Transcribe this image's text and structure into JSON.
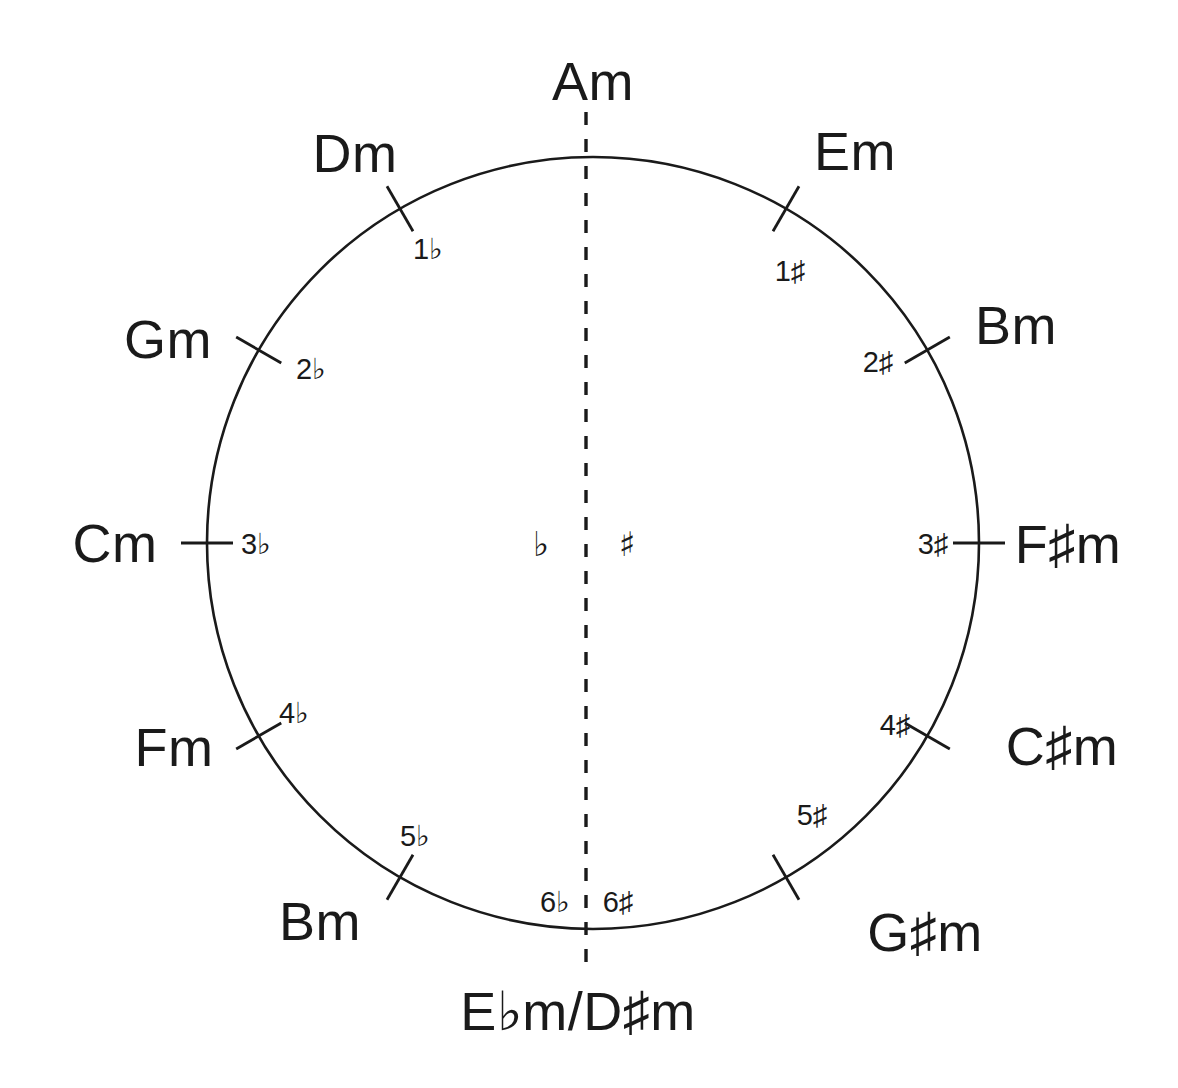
{
  "diagram": {
    "stroke_color": "#1a1a1a",
    "background_color": "#ffffff",
    "center_markers": {
      "flat_side": "♭",
      "sharp_side": "♯"
    },
    "positions": [
      {
        "id": "am",
        "key_label": "Am",
        "count_label": "",
        "angle_deg": 0,
        "label_x": 593,
        "label_y": 100,
        "label_anchor": "middle",
        "count_x": 0,
        "count_y": 0,
        "count_anchor": "middle",
        "has_tick": false
      },
      {
        "id": "em",
        "key_label": "Em",
        "count_label": "1♯",
        "angle_deg": 30,
        "label_x": 855,
        "label_y": 170,
        "label_anchor": "middle",
        "count_x": 790,
        "count_y": 281,
        "count_anchor": "middle",
        "has_tick": true
      },
      {
        "id": "bm",
        "key_label": "Bm",
        "count_label": "2♯",
        "angle_deg": 60,
        "label_x": 1016,
        "label_y": 344,
        "label_anchor": "middle",
        "count_x": 878,
        "count_y": 372,
        "count_anchor": "middle",
        "has_tick": true
      },
      {
        "id": "fsm",
        "key_label": "F♯m",
        "count_label": "3♯",
        "angle_deg": 90,
        "label_x": 1068,
        "label_y": 563,
        "label_anchor": "middle",
        "count_x": 933,
        "count_y": 554,
        "count_anchor": "middle",
        "has_tick": true
      },
      {
        "id": "csm",
        "key_label": "C♯m",
        "count_label": "4♯",
        "angle_deg": 120,
        "label_x": 1062,
        "label_y": 765,
        "label_anchor": "middle",
        "count_x": 895,
        "count_y": 735,
        "count_anchor": "middle",
        "has_tick": true
      },
      {
        "id": "gsm",
        "key_label": "G♯m",
        "count_label": "5♯",
        "angle_deg": 150,
        "label_x": 925,
        "label_y": 951,
        "label_anchor": "middle",
        "count_x": 812,
        "count_y": 825,
        "count_anchor": "middle",
        "has_tick": true
      },
      {
        "id": "ebm-dsm",
        "key_label": "E♭m/D♯m",
        "count_label": "",
        "angle_deg": 180,
        "label_x": 578,
        "label_y": 1030,
        "label_anchor": "middle",
        "count_x": 0,
        "count_y": 0,
        "count_anchor": "middle",
        "has_tick": false
      },
      {
        "id": "bbm",
        "key_label": "Bm",
        "count_label": "5♭",
        "angle_deg": 210,
        "label_x": 320,
        "label_y": 940,
        "label_anchor": "middle",
        "count_x": 415,
        "count_y": 846,
        "count_anchor": "middle",
        "has_tick": true
      },
      {
        "id": "fm",
        "key_label": "Fm",
        "count_label": "4♭",
        "angle_deg": 240,
        "label_x": 174,
        "label_y": 766,
        "label_anchor": "middle",
        "count_x": 294,
        "count_y": 723,
        "count_anchor": "middle",
        "has_tick": true
      },
      {
        "id": "cm",
        "key_label": "Cm",
        "count_label": "3♭",
        "angle_deg": 270,
        "label_x": 115,
        "label_y": 562,
        "label_anchor": "middle",
        "count_x": 256,
        "count_y": 554,
        "count_anchor": "middle",
        "has_tick": true
      },
      {
        "id": "gm",
        "key_label": "Gm",
        "count_label": "2♭",
        "angle_deg": 300,
        "label_x": 168,
        "label_y": 358,
        "label_anchor": "middle",
        "count_x": 311,
        "count_y": 379,
        "count_anchor": "middle",
        "has_tick": true
      },
      {
        "id": "dm",
        "key_label": "Dm",
        "count_label": "1♭",
        "angle_deg": 330,
        "label_x": 355,
        "label_y": 172,
        "label_anchor": "middle",
        "count_x": 428,
        "count_y": 259,
        "count_anchor": "middle",
        "has_tick": true
      }
    ],
    "bottom_counts": {
      "flat": "6♭",
      "sharp": "6♯"
    }
  }
}
